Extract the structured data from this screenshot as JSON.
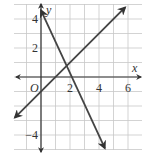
{
  "chart_data": {
    "type": "line",
    "title": "",
    "xlabel": "x",
    "ylabel": "y",
    "xlim": [
      -2,
      7
    ],
    "ylim": [
      -5,
      5
    ],
    "grid": true,
    "origin_label": "O",
    "x_ticks": [
      2,
      4,
      6
    ],
    "x_tick_labels": [
      "2",
      "4",
      "6"
    ],
    "y_ticks": [
      4,
      2,
      -4
    ],
    "y_tick_labels": [
      "4",
      "2",
      "−4"
    ],
    "series": [
      {
        "name": "line-1",
        "equation": "y = -2x + 4",
        "slope": -2,
        "intercept": 4,
        "x": [
          0,
          5
        ],
        "y": [
          4,
          -6
        ]
      },
      {
        "name": "line-2",
        "equation": "y = x - 1",
        "slope": 1,
        "intercept": -1,
        "x": [
          -2,
          5.8
        ],
        "y": [
          -3,
          4.8
        ]
      }
    ],
    "intersection": [
      1.67,
      0.67
    ]
  },
  "colors": {
    "grid": "#c8c8c8",
    "axis": "#333333",
    "line": "#444444"
  }
}
